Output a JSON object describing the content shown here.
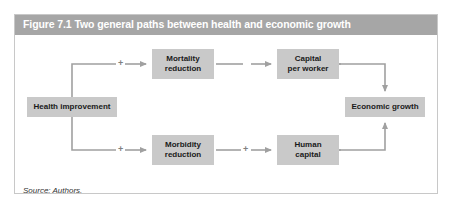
{
  "figure": {
    "title": "Figure 7.1 Two general paths between health and economic growth",
    "source": "Source: Authors.",
    "title_bar_color": "#a6a6a6",
    "title_text_color": "#ffffff",
    "node_fill_color": "#c9c9c9",
    "connector_color": "#a0a0a0",
    "frame_border_color": "#c8c8c8",
    "background_color": "#ffffff"
  },
  "diagram": {
    "type": "flowchart",
    "nodes": [
      {
        "id": "health-improvement",
        "label": "Health improvement",
        "lines": [
          "Health improvement"
        ]
      },
      {
        "id": "mortality-reduction",
        "label": "Mortality reduction",
        "lines": [
          "Mortality",
          "reduction"
        ]
      },
      {
        "id": "morbidity-reduction",
        "label": "Morbidity reduction",
        "lines": [
          "Morbidity",
          "reduction"
        ]
      },
      {
        "id": "capital-per-worker",
        "label": "Capital per worker",
        "lines": [
          "Capital",
          "per worker"
        ]
      },
      {
        "id": "human-capital",
        "label": "Human capital",
        "lines": [
          "Human",
          "capital"
        ]
      },
      {
        "id": "economic-growth",
        "label": "Economic growth",
        "lines": [
          "Economic growth"
        ]
      }
    ],
    "edges": [
      {
        "id": "health-to-mortality",
        "from": "health-improvement",
        "to": "mortality-reduction",
        "sign": "+",
        "style": "solid"
      },
      {
        "id": "health-to-morbidity",
        "from": "health-improvement",
        "to": "morbidity-reduction",
        "sign": "+",
        "style": "solid"
      },
      {
        "id": "mortality-to-capital",
        "from": "mortality-reduction",
        "to": "capital-per-worker",
        "sign": "",
        "style": "dashed"
      },
      {
        "id": "morbidity-to-human-capital",
        "from": "morbidity-reduction",
        "to": "human-capital",
        "sign": "+",
        "style": "solid"
      },
      {
        "id": "capital-to-growth",
        "from": "capital-per-worker",
        "to": "economic-growth",
        "sign": "+",
        "style": "solid"
      },
      {
        "id": "human-capital-to-growth",
        "from": "human-capital",
        "to": "economic-growth",
        "sign": "+",
        "style": "solid"
      }
    ],
    "signs": {
      "top_left": "+",
      "bottom_left": "+",
      "bottom_middle": "+",
      "top_right": "+",
      "bottom_right": "+"
    }
  }
}
